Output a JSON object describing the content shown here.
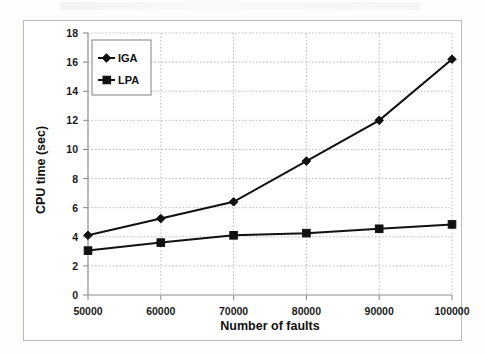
{
  "figure": {
    "background_color": "#fdfdfb",
    "plot_background_color": "#ffffff",
    "frame_color": "#b9b9b9",
    "line_color": "#111111",
    "grid_color": "#bdbdbd"
  },
  "chart_data": {
    "type": "line",
    "title": "",
    "xlabel": "Number of faults",
    "ylabel": "CPU time (sec)",
    "x": [
      50000,
      60000,
      70000,
      80000,
      90000,
      100000
    ],
    "xtick_labels": [
      "50000",
      "60000",
      "70000",
      "80000",
      "90000",
      "100000"
    ],
    "ytick_labels": [
      "0",
      "2",
      "4",
      "6",
      "8",
      "10",
      "12",
      "14",
      "16",
      "18"
    ],
    "yticks": [
      0,
      2,
      4,
      6,
      8,
      10,
      12,
      14,
      16,
      18
    ],
    "xlim": [
      50000,
      100000
    ],
    "ylim": [
      0,
      18
    ],
    "grid": true,
    "grid_style": "dotted",
    "legend_position": "upper-left-inside",
    "series": [
      {
        "name": "IGA",
        "marker": "diamond",
        "color": "#111111",
        "values": [
          4.1,
          5.25,
          6.4,
          9.2,
          12.0,
          16.2
        ]
      },
      {
        "name": "LPA",
        "marker": "square",
        "color": "#111111",
        "values": [
          3.05,
          3.6,
          4.1,
          4.25,
          4.55,
          4.85
        ]
      }
    ]
  },
  "legend": {
    "entries": [
      {
        "label": "IGA",
        "marker": "diamond"
      },
      {
        "label": "LPA",
        "marker": "square"
      }
    ]
  }
}
